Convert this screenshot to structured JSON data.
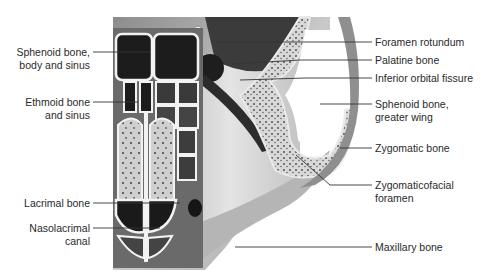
{
  "figure": {
    "colors": {
      "background": "#ffffff",
      "label_text": "#2a2a2a",
      "leader_line": "#333333",
      "bone_light": "#d9d9d9",
      "bone_mid": "#9a9a9a",
      "sinus_dark": "#1c1c1c",
      "septum_white": "#f2f2f2"
    },
    "labels_left": [
      {
        "id": "sphenoid-body",
        "line1": "Sphenoid bone,",
        "line2": "body and sinus"
      },
      {
        "id": "ethmoid",
        "line1": "Ethmoid bone",
        "line2": "and sinus"
      },
      {
        "id": "lacrimal",
        "line1": "Lacrimal bone",
        "line2": ""
      },
      {
        "id": "nasolacrimal",
        "line1": "Nasolacrimal",
        "line2": "canal"
      }
    ],
    "labels_right": [
      {
        "id": "foramen-rotundum",
        "line1": "Foramen rotundum",
        "line2": ""
      },
      {
        "id": "palatine",
        "line1": "Palatine bone",
        "line2": ""
      },
      {
        "id": "inferior-orbital-fissure",
        "line1": "Inferior orbital fissure",
        "line2": ""
      },
      {
        "id": "sphenoid-greater-wing",
        "line1": "Sphenoid bone,",
        "line2": "greater wing"
      },
      {
        "id": "zygomatic",
        "line1": "Zygomatic bone",
        "line2": ""
      },
      {
        "id": "zygomaticofacial",
        "line1": "Zygomaticofacial",
        "line2": "foramen"
      },
      {
        "id": "maxillary",
        "line1": "Maxillary bone",
        "line2": ""
      }
    ]
  }
}
